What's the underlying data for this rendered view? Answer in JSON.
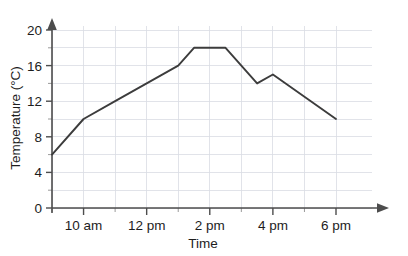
{
  "chart_data": {
    "type": "line",
    "title": "",
    "xlabel": "Time",
    "ylabel": "Temperature (°C)",
    "x": [
      "9 am",
      "10 am",
      "11 am",
      "12 pm",
      "1 pm",
      "1:30 pm",
      "2:30 pm",
      "3:30 pm",
      "4 pm",
      "6 pm"
    ],
    "values": [
      6,
      10,
      12,
      14,
      16,
      18,
      18,
      14,
      15,
      10
    ],
    "x_hours": [
      9,
      10,
      11,
      12,
      13,
      13.5,
      14.5,
      15.5,
      16,
      18
    ],
    "xlim": [
      9,
      18
    ],
    "ylim": [
      0,
      20
    ],
    "y_ticks": [
      0,
      4,
      8,
      12,
      16,
      20
    ],
    "y_minor_step": 2,
    "x_ticks": [
      10,
      12,
      14,
      16,
      18
    ],
    "x_tick_labels": [
      "10 am",
      "12 pm",
      "2 pm",
      "4 pm",
      "6 pm"
    ],
    "x_minor_step": 1,
    "grid": true,
    "legend": "none",
    "line_color": "#3c3c3c",
    "grid_color": "#d9dce3",
    "axis_color": "#4d4d4d"
  },
  "axes": {
    "y_tick_labels": [
      "0",
      "4",
      "8",
      "12",
      "16",
      "20"
    ],
    "x_tick_labels": [
      "10 am",
      "12 pm",
      "2 pm",
      "4 pm",
      "6 pm"
    ],
    "y_title": "Temperature (°C)",
    "x_title": "Time"
  }
}
